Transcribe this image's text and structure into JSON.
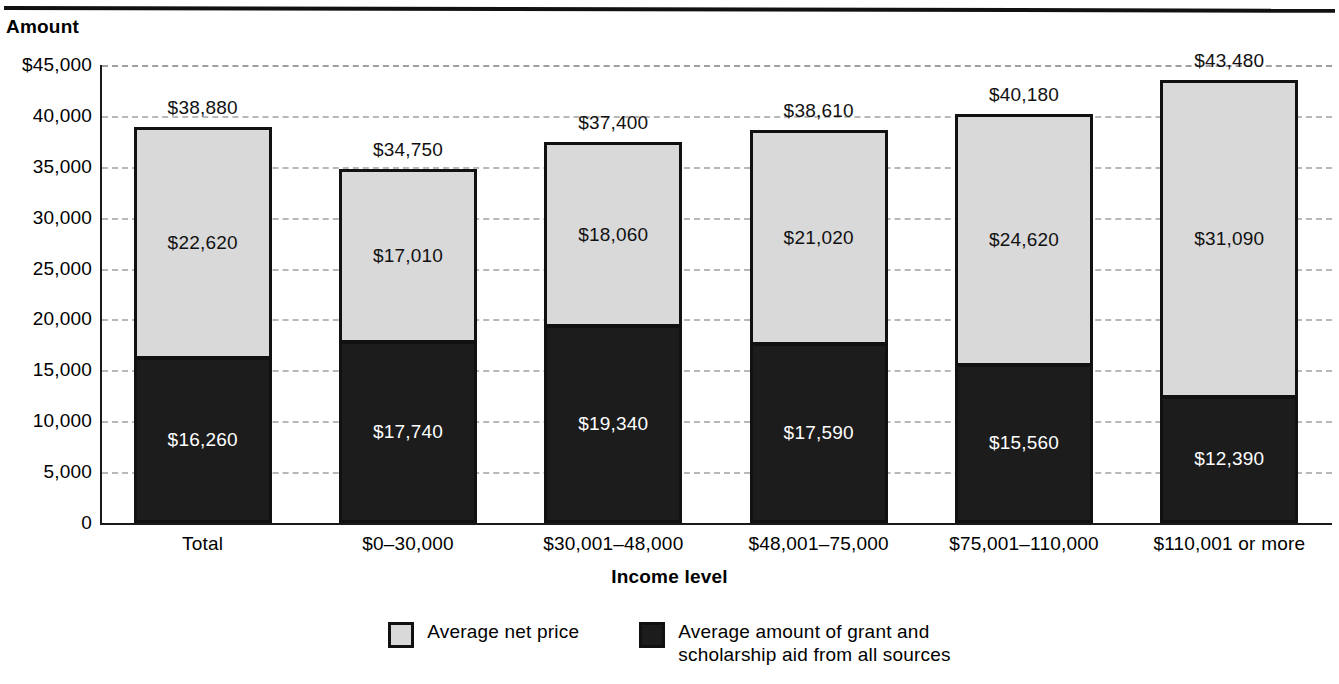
{
  "axes": {
    "y_title": "Amount",
    "x_title": "Income level",
    "y_ticks": [
      "$45,000",
      "40,000",
      "35,000",
      "30,000",
      "25,000",
      "20,000",
      "15,000",
      "10,000",
      "5,000",
      "0"
    ]
  },
  "legend": {
    "items": [
      {
        "label": "Average net price",
        "swatch": "light"
      },
      {
        "label": "Average amount of grant and\nscholarship aid from all sources",
        "swatch": "dark"
      }
    ]
  },
  "bars": [
    {
      "category": "Total",
      "net_price": "$22,620",
      "aid": "$16,260",
      "total": "$38,880"
    },
    {
      "category": "$0–30,000",
      "net_price": "$17,010",
      "aid": "$17,740",
      "total": "$34,750"
    },
    {
      "category": "$30,001–48,000",
      "net_price": "$18,060",
      "aid": "$19,340",
      "total": "$37,400"
    },
    {
      "category": "$48,001–75,000",
      "net_price": "$21,020",
      "aid": "$17,590",
      "total": "$38,610"
    },
    {
      "category": "$75,001–110,000",
      "net_price": "$24,620",
      "aid": "$15,560",
      "total": "$40,180"
    },
    {
      "category": "$110,001 or more",
      "net_price": "$31,090",
      "aid": "$12,390",
      "total": "$43,480"
    }
  ],
  "colors": {
    "net_price": "#d9d9d9",
    "aid": "#1c1c1c",
    "outline": "#111111",
    "gridline": "#b8b8b8"
  },
  "chart_data": {
    "type": "bar",
    "subtype": "stacked-vertical",
    "title": "",
    "xlabel": "Income level",
    "ylabel": "Amount",
    "ylim": [
      0,
      45000
    ],
    "ytick_values": [
      0,
      5000,
      10000,
      15000,
      20000,
      25000,
      30000,
      35000,
      40000,
      45000
    ],
    "ytick_labels": [
      "0",
      "5,000",
      "10,000",
      "15,000",
      "20,000",
      "25,000",
      "30,000",
      "35,000",
      "40,000",
      "$45,000"
    ],
    "grid": true,
    "grid_axis": "y",
    "grid_style": "dashed",
    "legend_position": "bottom-center",
    "categories": [
      "Total",
      "$0–30,000",
      "$30,001–48,000",
      "$48,001–75,000",
      "$75,001–110,000",
      "$110,001 or more"
    ],
    "series": [
      {
        "name": "Average amount of grant and scholarship aid from all sources",
        "color": "#1c1c1c",
        "stack_order": 0,
        "values": [
          16260,
          17740,
          19340,
          17590,
          15560,
          12390
        ],
        "labels": [
          "$16,260",
          "$17,740",
          "$19,340",
          "$17,590",
          "$15,560",
          "$12,390"
        ]
      },
      {
        "name": "Average net price",
        "color": "#d9d9d9",
        "stack_order": 1,
        "values": [
          22620,
          17010,
          18060,
          21020,
          24620,
          31090
        ],
        "labels": [
          "$22,620",
          "$17,010",
          "$18,060",
          "$21,020",
          "$24,620",
          "$31,090"
        ]
      }
    ],
    "totals": [
      38880,
      34750,
      37400,
      38610,
      40180,
      43480
    ],
    "total_labels": [
      "$38,880",
      "$34,750",
      "$37,400",
      "$38,610",
      "$40,180",
      "$43,480"
    ]
  }
}
